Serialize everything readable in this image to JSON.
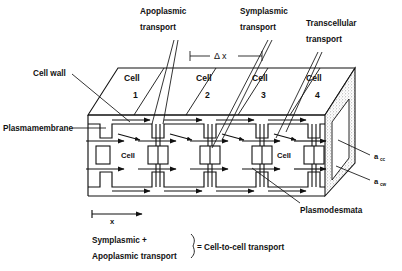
{
  "figure": {
    "dx_label": "Δ x",
    "axis_label": "x"
  },
  "callouts": {
    "apoplasmic": {
      "line1": "Apoplasmic",
      "line2": "transport"
    },
    "symplasmic": {
      "line1": "Symplasmic",
      "line2": "transport"
    },
    "transcellular": {
      "line1": "Transcellular",
      "line2": "transport"
    },
    "cell_wall": "Cell wall",
    "plasmamembrane": "Plasmamembrane",
    "plasmodesmata": "Plasmodesmata"
  },
  "cells": [
    {
      "label": "Cell",
      "number": "1"
    },
    {
      "label": "Cell",
      "number": "2"
    },
    {
      "label": "Cell",
      "number": "3"
    },
    {
      "label": "Cell",
      "number": "4"
    }
  ],
  "inner_labels": {
    "left": "Cell",
    "right": "Cell"
  },
  "area_labels": {
    "cc": {
      "base": "a",
      "sub": "cc"
    },
    "cw": {
      "base": "a",
      "sub": "cw"
    }
  },
  "legend": {
    "line1": "Symplasmic +",
    "line2": "Apoplasmic transport",
    "equals": "= Cell-to-cell transport"
  },
  "colors": {
    "ink": "#111111",
    "background": "#ffffff",
    "stipple": "#9a9a9a"
  }
}
